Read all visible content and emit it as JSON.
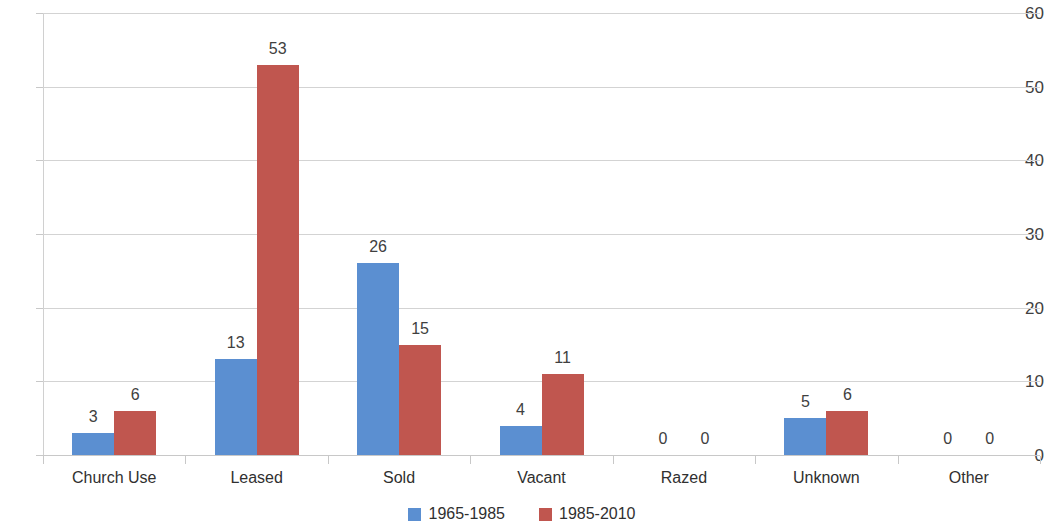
{
  "chart_data": {
    "type": "bar",
    "title": "",
    "subtitle": "",
    "xlabel": "",
    "ylabel": "",
    "ylim": [
      0,
      60
    ],
    "y_ticks": [
      0,
      10,
      20,
      30,
      40,
      50,
      60
    ],
    "y_tick_labels": [
      "0",
      "10",
      "20",
      "30",
      "40",
      "50",
      "60"
    ],
    "grid": true,
    "grid_axis": "y",
    "legend_position": "bottom",
    "bar_labels_shown": true,
    "categories": [
      "Church Use",
      "Leased",
      "Sold",
      "Vacant",
      "Razed",
      "Unknown",
      "Other"
    ],
    "series": [
      {
        "name": "1965-1985",
        "color": "#5B8FD1",
        "values": [
          3,
          13,
          26,
          4,
          0,
          5,
          0
        ],
        "value_labels": [
          "3",
          "13",
          "26",
          "4",
          "0",
          "5",
          "0"
        ]
      },
      {
        "name": "1985-2010",
        "color": "#C0564F",
        "values": [
          6,
          53,
          15,
          11,
          0,
          6,
          0
        ],
        "value_labels": [
          "6",
          "53",
          "15",
          "11",
          "0",
          "6",
          "0"
        ]
      }
    ]
  },
  "legend": {
    "items": [
      {
        "label": "1965-1985",
        "color": "#5B8FD1",
        "swatch_name": "legend-swatch-1965-1985"
      },
      {
        "label": "1985-2010",
        "color": "#C0564F",
        "swatch_name": "legend-swatch-1985-2010"
      }
    ]
  }
}
